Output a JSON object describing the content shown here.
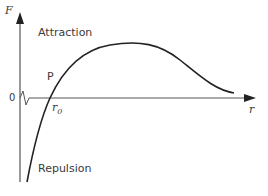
{
  "diagram": {
    "type": "force-vs-separation curve",
    "y_axis_label": "F",
    "x_axis_label": "r",
    "origin_label": "0",
    "region_labels": {
      "attraction": "Attraction",
      "repulsion": "Repulsion"
    },
    "point_label": "P",
    "equilibrium_label": "r",
    "equilibrium_subscript": "0",
    "colors": {
      "curve": "#222222",
      "axes": "#555555",
      "text": "#3a3a3a"
    }
  }
}
